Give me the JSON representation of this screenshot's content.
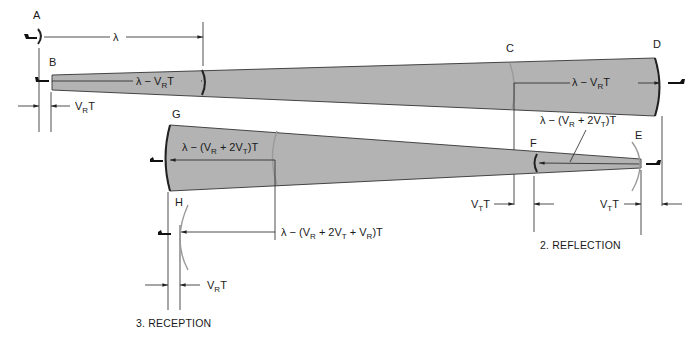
{
  "figure": {
    "points": {
      "A": "A",
      "B": "B",
      "C": "C",
      "D": "D",
      "E": "E",
      "F": "F",
      "G": "G",
      "H": "H"
    },
    "stage1": {
      "wavelength": "λ",
      "beam_label_prefix": "λ − V",
      "beam_label_sub": "R",
      "beam_label_suffix": "T",
      "offset_prefix": "V",
      "offset_sub": "R",
      "offset_suffix": "T"
    },
    "stage1_far": {
      "beam_label_prefix": "λ − V",
      "beam_label_sub": "R",
      "beam_label_suffix": "T"
    },
    "reflection": {
      "caption": "2. REFLECTION",
      "reflected_label_a": "λ − (V",
      "reflected_label_sub1": "R",
      "reflected_label_b": " + 2V",
      "reflected_label_sub2": "T",
      "reflected_label_c": ")T",
      "offset_left_prefix": "V",
      "offset_left_sub": "T",
      "offset_left_suffix": "T",
      "offset_right_prefix": "V",
      "offset_right_sub": "T",
      "offset_right_suffix": "T"
    },
    "return_beam": {
      "label_a": "λ − (V",
      "label_sub1": "R",
      "label_b": " + 2V",
      "label_sub2": "T",
      "label_c": ")T"
    },
    "reception": {
      "caption": "3. RECEPTION",
      "received_label_a": "λ − (V",
      "received_label_sub1": "R",
      "received_label_b": " + 2V",
      "received_label_sub2": "T",
      "received_label_c": " + V",
      "received_label_sub3": "R",
      "received_label_d": ")T",
      "offset_prefix": "V",
      "offset_sub": "R",
      "offset_suffix": "T"
    },
    "colors": {
      "beam_fill": "#b3b3b3",
      "line": "#222222",
      "ghost_front": "#9a9a9a"
    }
  }
}
